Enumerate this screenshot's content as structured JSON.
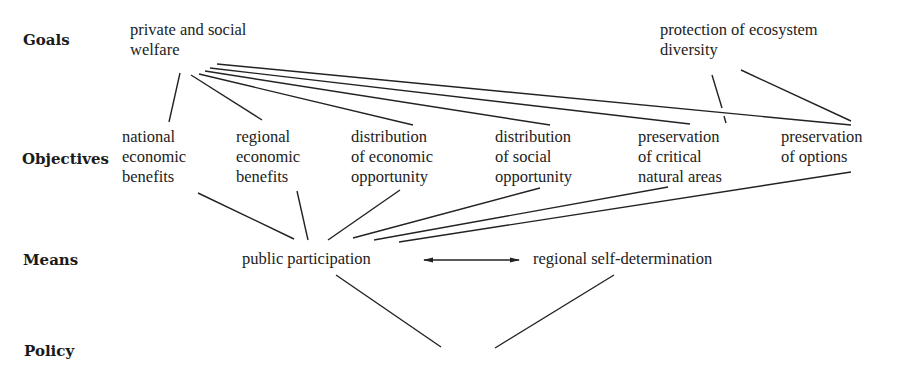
{
  "levels": {
    "goals": "Goals",
    "objectives": "Objectives",
    "means": "Means",
    "policy": "Policy"
  },
  "goals": [
    {
      "id": "welfare",
      "text": "private and social\nwelfare"
    },
    {
      "id": "ecosystem",
      "text": "protection of ecosystem\ndiversity"
    }
  ],
  "objectives": [
    {
      "id": "national",
      "text": "national\neconomic\nbenefits"
    },
    {
      "id": "regional",
      "text": "regional\neconomic\nbenefits"
    },
    {
      "id": "dist_econ",
      "text": "distribution\nof economic\nopportunity"
    },
    {
      "id": "dist_social",
      "text": "distribution\nof social\nopportunity"
    },
    {
      "id": "pres_critical",
      "text": "preservation\nof critical\nnatural areas"
    },
    {
      "id": "pres_options",
      "text": "preservation\nof options"
    }
  ],
  "means": [
    {
      "id": "participation",
      "text": "public participation"
    },
    {
      "id": "self_determination",
      "text": "regional self-determination"
    }
  ],
  "edges": [
    [
      "welfare",
      "national"
    ],
    [
      "welfare",
      "regional"
    ],
    [
      "welfare",
      "dist_econ"
    ],
    [
      "welfare",
      "dist_social"
    ],
    [
      "welfare",
      "pres_critical"
    ],
    [
      "welfare",
      "pres_options"
    ],
    [
      "ecosystem",
      "pres_critical"
    ],
    [
      "ecosystem",
      "pres_options"
    ],
    [
      "national",
      "participation"
    ],
    [
      "regional",
      "participation"
    ],
    [
      "dist_econ",
      "participation"
    ],
    [
      "dist_social",
      "participation"
    ],
    [
      "pres_critical",
      "participation"
    ],
    [
      "pres_options",
      "participation"
    ],
    [
      "participation",
      "self_determination",
      "bidirectional"
    ],
    [
      "participation",
      "policy"
    ],
    [
      "self_determination",
      "policy"
    ]
  ]
}
